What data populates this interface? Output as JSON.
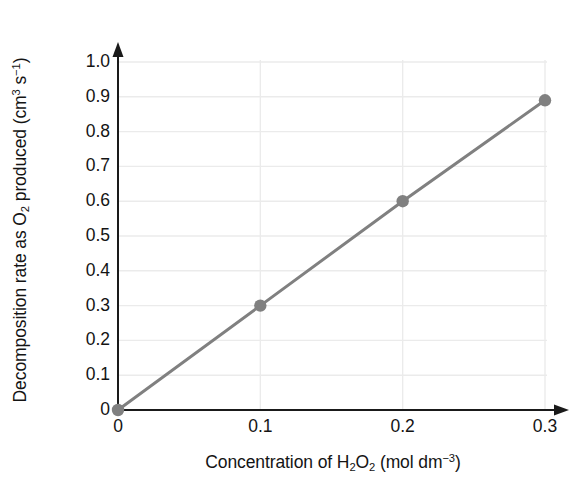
{
  "chart_data": {
    "type": "line",
    "title": "",
    "subtitle": "",
    "xlabel_plain": "Concentration of H2O2 (mol dm-3)",
    "ylabel_plain": "Decomposition rate as O2 produced (cm3 s-1)",
    "x": [
      0,
      0.1,
      0.2,
      0.3
    ],
    "values": [
      0,
      0.3,
      0.6,
      0.89
    ],
    "series": [
      {
        "name": "Decomposition rate",
        "x": [
          0,
          0.1,
          0.2,
          0.3
        ],
        "values": [
          0,
          0.3,
          0.6,
          0.89
        ],
        "color": "#808080",
        "marker": "circle"
      }
    ],
    "xlim": [
      0,
      0.3
    ],
    "ylim": [
      0,
      1.0
    ],
    "xticks": [
      0,
      0.1,
      0.2,
      0.3
    ],
    "yticks": [
      0,
      0.1,
      0.2,
      0.3,
      0.4,
      0.5,
      0.6,
      0.7,
      0.8,
      0.9,
      1.0
    ],
    "xtick_labels": [
      "0",
      "0.1",
      "0.2",
      "0.3"
    ],
    "ytick_labels": [
      "0",
      "0.1",
      "0.2",
      "0.3",
      "0.4",
      "0.5",
      "0.6",
      "0.7",
      "0.8",
      "0.9",
      "1.0"
    ],
    "grid": true,
    "grid_color": "#ebebeb",
    "legend": null,
    "legend_position": "none",
    "axis_color": "#1a1a1a",
    "axis_arrows": true,
    "annotations": []
  },
  "axes": {
    "y_title": {
      "part1": "Decomposition rate as O",
      "sub1": "2",
      "part2": " produced (cm",
      "sup1": "3",
      "part3": " s",
      "sup2": "−1",
      "part4": ")"
    },
    "x_title": {
      "part1": "Concentration of H",
      "sub1": "2",
      "part2": "O",
      "sub2": "2",
      "part3": " (mol dm",
      "sup1": "−3",
      "part4": ")"
    }
  }
}
